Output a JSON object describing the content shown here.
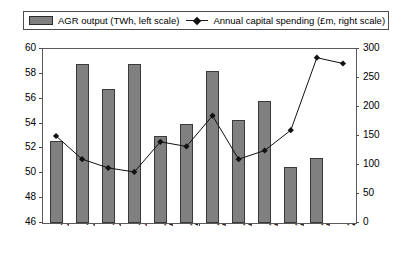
{
  "legend": {
    "entries": [
      {
        "label": "AGR output (TWh, left scale)",
        "marker": "bar-swatch-icon",
        "color": "#808080"
      },
      {
        "label": "Annual capital spending (£m, right scale)",
        "marker": "line-diamond-icon",
        "color": "#111111"
      }
    ]
  },
  "chart_data": {
    "type": "bar",
    "title": "",
    "xlabel": "",
    "grid": false,
    "legend_position": "top",
    "categories": [
      "1996",
      "1997",
      "1998",
      "1999",
      "2000",
      "2001",
      "2002",
      "2003",
      "2004",
      "2005",
      "2006",
      "2007F"
    ],
    "series": [
      {
        "name": "AGR output (TWh, left scale)",
        "type": "bar",
        "axis": "left",
        "unit": "TWh",
        "color": "#808080",
        "values": [
          52.6,
          58.8,
          56.8,
          58.8,
          53.0,
          54.0,
          58.2,
          54.3,
          55.8,
          50.5,
          51.2,
          null
        ]
      },
      {
        "name": "Annual capital spending (£m, right scale)",
        "type": "line",
        "axis": "right",
        "unit": "£m",
        "color": "#111111",
        "values": [
          150,
          110,
          95,
          88,
          140,
          132,
          185,
          110,
          125,
          160,
          285,
          275
        ]
      }
    ],
    "left_axis": {
      "label": "TWh",
      "ylim": [
        46,
        60
      ],
      "ticks": [
        46,
        48,
        50,
        52,
        54,
        56,
        58,
        60
      ]
    },
    "right_axis": {
      "label": "£m",
      "ylim": [
        0,
        300
      ],
      "ticks": [
        0,
        50,
        100,
        150,
        200,
        250,
        300
      ]
    }
  }
}
